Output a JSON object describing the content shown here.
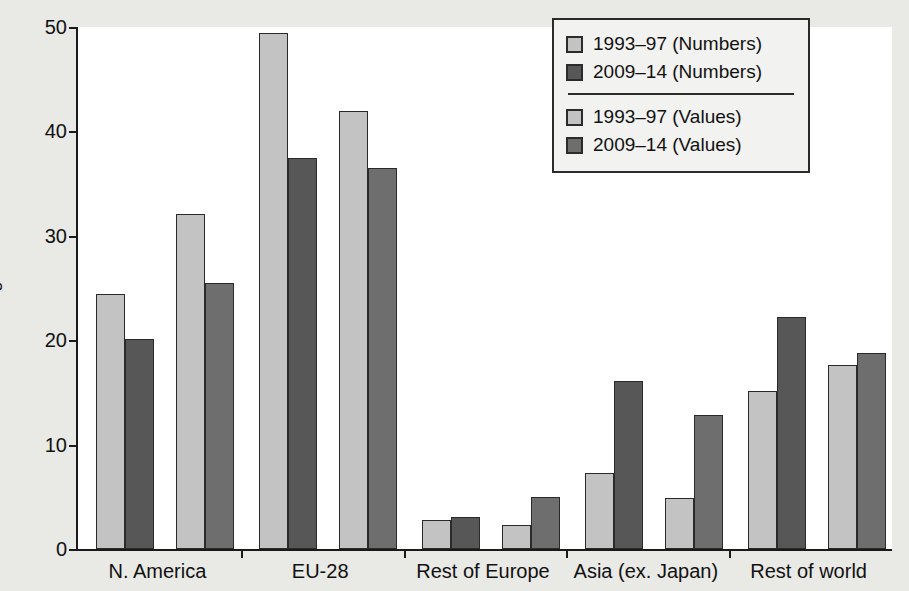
{
  "chart_data": {
    "type": "bar",
    "title": "",
    "subtitle": "",
    "xlabel": "",
    "ylabel": "Percentage of total",
    "ylim": [
      0,
      50
    ],
    "yticks": [
      0,
      10,
      20,
      30,
      40,
      50
    ],
    "ytick_labels": [
      "0",
      "10",
      "20",
      "30",
      "40",
      "50"
    ],
    "grid": false,
    "legend_position": "top-right",
    "categories": [
      "N. America",
      "EU-28",
      "Rest of Europe",
      "Asia (ex. Japan)",
      "Rest of world"
    ],
    "series": [
      {
        "name": "1993–97 (Numbers)",
        "color": "#c3c3c3",
        "values": [
          24.4,
          49.4,
          2.8,
          7.3,
          15.1
        ]
      },
      {
        "name": "2009–14 (Numbers)",
        "color": "#575757",
        "values": [
          20.1,
          37.5,
          3.1,
          16.1,
          22.2
        ]
      },
      {
        "name": "1993–97 (Values)",
        "color": "#c3c3c3",
        "values": [
          32.1,
          42.0,
          2.3,
          4.9,
          17.6
        ]
      },
      {
        "name": "2009–14 (Values)",
        "color": "#6e6e6e",
        "values": [
          25.5,
          36.5,
          5.0,
          12.8,
          18.8
        ]
      }
    ]
  },
  "legend": {
    "items": [
      {
        "label": "1993–97 (Numbers)",
        "color": "#c3c3c3"
      },
      {
        "label": "2009–14 (Numbers)",
        "color": "#575757"
      },
      {
        "label": "1993–97 (Values)",
        "color": "#c3c3c3"
      },
      {
        "label": "2009–14 (Values)",
        "color": "#6e6e6e"
      }
    ],
    "divider_after_index": 1
  },
  "colors": {
    "figure_background": "#e9e9e6",
    "plot_background": "#ffffff",
    "axis": "#1a1a1a",
    "bar_edge": "#2a2a2a",
    "light_fill": "#c3c3c3",
    "dark_fill": "#575757"
  }
}
